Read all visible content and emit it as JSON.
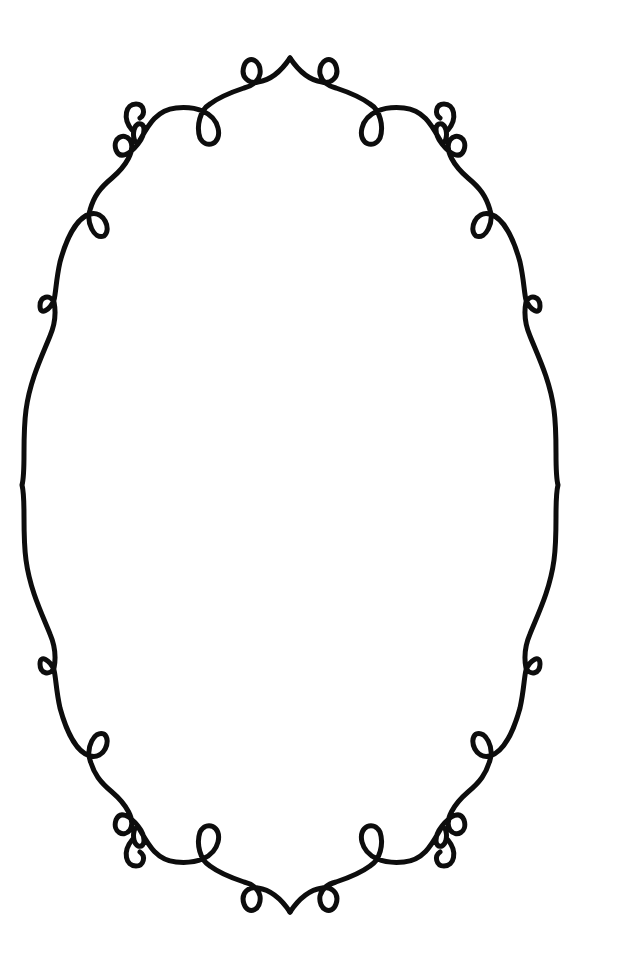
{
  "canvas": {
    "width": 619,
    "height": 963,
    "background": "#ffffff"
  },
  "frame": {
    "shape": "ornamental-oval",
    "stroke_color": "#0d0d0d",
    "stroke_width": 5,
    "center": {
      "x": 290,
      "y": 485
    },
    "bounds": {
      "left": 20,
      "right": 560,
      "top": 58,
      "bottom": 912
    },
    "ornaments": {
      "top_point": {
        "x": 290,
        "y": 58
      },
      "bottom_point": {
        "x": 290,
        "y": 912
      },
      "side_points": [
        {
          "x": 20,
          "y": 485
        },
        {
          "x": 560,
          "y": 485
        }
      ],
      "loops_count": 16,
      "scroll_curls_count": 4
    }
  }
}
